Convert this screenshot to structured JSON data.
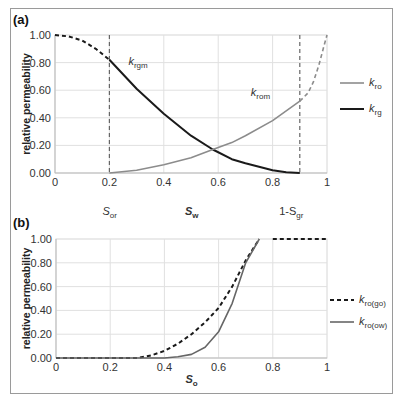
{
  "chart_data": [
    {
      "type": "line",
      "panel_label": "(a)",
      "ylabel": "relative permeability",
      "xlabel_main": "S",
      "xlabel_main_sub": "w",
      "xlim": [
        0,
        1
      ],
      "ylim": [
        0,
        1
      ],
      "xticks": [
        "0",
        "0.2",
        "0.4",
        "0.6",
        "0.8",
        "1"
      ],
      "yticks": [
        "0.00",
        "0.20",
        "0.40",
        "0.60",
        "0.80",
        "1.00"
      ],
      "grid": true,
      "vlines": [
        0.2,
        0.9
      ],
      "xannotations": [
        {
          "x": 0.2,
          "text": "S",
          "sub": "or"
        },
        {
          "x": 0.85,
          "text": "1-S",
          "sub": "gr"
        }
      ],
      "curve_labels": [
        {
          "text": "k",
          "sub": "rgm",
          "x": 0.27,
          "y": 0.78
        },
        {
          "text": "k",
          "sub": "rom",
          "x": 0.72,
          "y": 0.56
        }
      ],
      "legend": {
        "placement": "right",
        "entries": [
          {
            "text": "k",
            "sub": "ro",
            "color": "#8c8c8c",
            "style": "solid"
          },
          {
            "text": "k",
            "sub": "rg",
            "color": "#1a1a1a",
            "style": "solid"
          }
        ]
      },
      "series": [
        {
          "name": "k_rg (extrapolated)",
          "color": "#1a1a1a",
          "style": "dashed",
          "x": [
            0,
            0.05,
            0.1,
            0.15,
            0.2
          ],
          "y": [
            1.0,
            0.99,
            0.96,
            0.9,
            0.82
          ]
        },
        {
          "name": "k_rg",
          "color": "#1a1a1a",
          "style": "solid",
          "x": [
            0.2,
            0.3,
            0.4,
            0.5,
            0.58,
            0.65,
            0.7,
            0.8,
            0.85,
            0.9
          ],
          "y": [
            0.82,
            0.61,
            0.43,
            0.27,
            0.17,
            0.1,
            0.07,
            0.02,
            0.005,
            0.0
          ]
        },
        {
          "name": "k_ro",
          "color": "#8c8c8c",
          "style": "solid",
          "x": [
            0.2,
            0.3,
            0.4,
            0.5,
            0.58,
            0.65,
            0.7,
            0.8,
            0.9
          ],
          "y": [
            0.0,
            0.02,
            0.06,
            0.11,
            0.17,
            0.22,
            0.27,
            0.38,
            0.52
          ]
        },
        {
          "name": "k_ro (extrapolated)",
          "color": "#8c8c8c",
          "style": "dashed",
          "x": [
            0.9,
            0.93,
            0.95,
            0.97,
            0.99,
            1.0
          ],
          "y": [
            0.52,
            0.58,
            0.66,
            0.78,
            0.93,
            1.0
          ]
        }
      ]
    },
    {
      "type": "line",
      "panel_label": "(b)",
      "ylabel": "relative permeability",
      "xlabel_main": "S",
      "xlabel_main_sub": "o",
      "xlim": [
        0,
        1
      ],
      "ylim": [
        0,
        1
      ],
      "xticks": [
        "0",
        "0.2",
        "0.4",
        "0.6",
        "0.8",
        "1"
      ],
      "yticks": [
        "0.00",
        "0.20",
        "0.40",
        "0.60",
        "0.80",
        "1.00"
      ],
      "grid": true,
      "legend": {
        "placement": "right",
        "entries": [
          {
            "text": "k",
            "sub": "ro(go)",
            "color": "#1a1a1a",
            "style": "dashed"
          },
          {
            "text": "k",
            "sub": "ro(ow)",
            "color": "#666666",
            "style": "solid"
          }
        ]
      },
      "series": [
        {
          "name": "k_ro(go)",
          "color": "#1a1a1a",
          "style": "dashed",
          "x": [
            0,
            0.3,
            0.35,
            0.4,
            0.45,
            0.5,
            0.55,
            0.6,
            0.65,
            0.7,
            0.75
          ],
          "y": [
            0,
            0,
            0.02,
            0.06,
            0.12,
            0.2,
            0.3,
            0.42,
            0.6,
            0.82,
            1.0
          ]
        },
        {
          "name": "k_ro(go) plateau",
          "color": "#1a1a1a",
          "style": "dashed",
          "x": [
            0.8,
            1.0
          ],
          "y": [
            1.0,
            1.0
          ]
        },
        {
          "name": "k_ro(ow)",
          "color": "#666666",
          "style": "solid",
          "x": [
            0,
            0.4,
            0.45,
            0.5,
            0.55,
            0.6,
            0.65,
            0.7,
            0.75
          ],
          "y": [
            0,
            0,
            0.01,
            0.03,
            0.09,
            0.22,
            0.46,
            0.8,
            1.0
          ]
        }
      ]
    }
  ]
}
